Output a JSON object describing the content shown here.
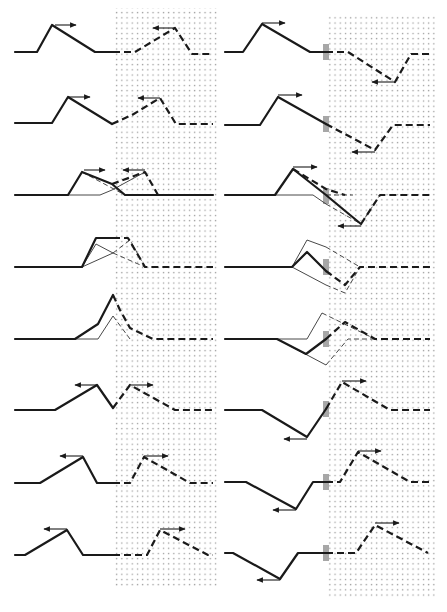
{
  "figure": {
    "colors": {
      "ink": "#1a1a1a",
      "stipple": "#9a9a9a",
      "background": "#ffffff",
      "boundary_marker": "#8a8a8a"
    },
    "regions": {
      "left_stipple": {
        "x": 113,
        "y": 8,
        "w": 104,
        "h": 580
      },
      "right_stipple": {
        "x": 326,
        "y": 15,
        "w": 110,
        "h": 582
      }
    },
    "left_column": [
      {
        "row": 1,
        "solid": "M15,52 L37,52 L52,25 L95,52 L113,52",
        "dash": "M113,52 L135,52 L175,28 L192,54 L213,54",
        "arrows": [
          [
            55,
            25,
            76,
            25
          ],
          [
            175,
            28,
            153,
            28
          ]
        ]
      },
      {
        "row": 2,
        "solid": "M15,123 L52,123 L68,97 L112,124",
        "dash": "M112,124 L132,115 L160,98 L176,124 L213,124",
        "arrows": [
          [
            68,
            97,
            90,
            97
          ],
          [
            160,
            98,
            138,
            98
          ]
        ]
      },
      {
        "row": 3,
        "solid": "M15,195 L68,195 L82,172 L112,184 L125,195 L213,195",
        "thin": "M68,195 L100,195 L112,190 L145,172",
        "thindash": "M82,172 L125,195",
        "dash": "M112,184 L145,172 L158,195 L213,195",
        "arrows": [
          [
            84,
            170,
            105,
            170
          ],
          [
            145,
            170,
            123,
            170
          ]
        ]
      },
      {
        "row": 4,
        "solid": "M15,267 L82,267 L96,238 L113,238",
        "thin": "M82,267 L96,244 L113,253 M82,267 L113,253",
        "thindash": "M113,253 L130,240 L145,267 M113,253 L145,267",
        "dash": "M113,238 L128,238 L145,267 L213,267"
      },
      {
        "row": 5,
        "solid": "M15,339 L75,339 L98,324 L113,295",
        "thin": "M75,339 L98,339 L113,316",
        "thindash": "M113,316 L130,339",
        "dash": "M113,295 L120,310 L130,328 L153,339 L213,339"
      },
      {
        "row": 6,
        "solid": "M15,410 L55,410 L97,385 L113,408",
        "dash": "M113,408 L130,385 L175,410 L213,410",
        "arrows": [
          [
            97,
            385,
            75,
            385
          ],
          [
            130,
            385,
            153,
            385
          ]
        ]
      },
      {
        "row": 7,
        "solid": "M15,483 L40,483 L83,457 L97,483 L113,483",
        "dash": "M113,483 L130,483 L144,457 L190,483 L213,483",
        "arrows": [
          [
            83,
            456,
            60,
            456
          ],
          [
            144,
            456,
            168,
            456
          ]
        ]
      },
      {
        "row": 8,
        "solid": "M15,555 L25,555 L67,530 L83,555 L113,555",
        "dash": "M113,555 L147,555 L160,530 L208,555 L213,555",
        "arrows": [
          [
            67,
            529,
            44,
            529
          ],
          [
            160,
            529,
            185,
            529
          ]
        ]
      }
    ],
    "right_column": [
      {
        "row": 1,
        "solid": "M225,52 L243,52 L262,24 L310,52 L326,52",
        "dash": "M326,52 L348,52 L395,82 L411,54 L430,54",
        "arrows": [
          [
            262,
            23,
            285,
            23
          ],
          [
            395,
            82,
            372,
            82
          ]
        ],
        "marker": [
          326,
          44,
          6,
          16
        ]
      },
      {
        "row": 2,
        "solid": "M225,125 L260,125 L278,97 L326,124",
        "dash": "M326,124 L375,150 L393,125 L430,125",
        "arrows": [
          [
            278,
            95,
            302,
            95
          ],
          [
            375,
            152,
            352,
            152
          ]
        ],
        "marker": [
          326,
          116,
          6,
          16
        ]
      },
      {
        "row": 3,
        "solid": "M225,195 L275,195 L293,169 L326,195 L344,210 L361,224",
        "thin": "M275,195 L313,195 L326,204",
        "thindash": "M326,195 L345,195 L353,195 M326,204 L361,224 L380,195",
        "dash": "M293,169 L326,189 L345,195 M361,224 L380,195 L430,195",
        "arrows": [
          [
            293,
            167,
            317,
            167
          ],
          [
            361,
            226,
            338,
            226
          ]
        ],
        "marker": [
          326,
          188,
          6,
          16
        ]
      },
      {
        "row": 4,
        "solid": "M225,267 L292,267 L307,252 L326,271",
        "thin": "M292,267 L307,240 L326,247 M292,267 L326,285",
        "thindash": "M326,247 L360,267 M326,285 L345,293 L360,267",
        "dash": "M326,271 L345,285 L360,267 L430,267",
        "marker": [
          326,
          259,
          6,
          16
        ]
      },
      {
        "row": 5,
        "solid": "M225,339 L277,339 L306,354 L326,339",
        "thin": "M277,339 L307,339 L322,313 M277,339 L326,365",
        "thindash": "M322,313 L375,339 M326,365 L348,339 L375,339",
        "dash": "M326,339 L345,322 L375,339 L430,339",
        "marker": [
          326,
          331,
          6,
          16
        ]
      },
      {
        "row": 6,
        "solid": "M225,410 L262,410 L307,437 L326,409",
        "dash": "M326,409 L342,382 L390,410 L430,410",
        "arrows": [
          [
            307,
            439,
            284,
            439
          ],
          [
            342,
            381,
            366,
            381
          ]
        ],
        "marker": [
          326,
          401,
          6,
          16
        ]
      },
      {
        "row": 7,
        "solid": "M225,482 L246,482 L296,509 L313,482 L326,482",
        "dash": "M326,482 L340,482 L358,452 L410,482 L430,482",
        "arrows": [
          [
            296,
            510,
            273,
            510
          ],
          [
            358,
            451,
            381,
            451
          ]
        ],
        "marker": [
          326,
          474,
          6,
          16
        ]
      },
      {
        "row": 8,
        "solid": "M225,553 L233,553 L280,579 L298,553 L326,553",
        "dash": "M326,553 L356,553 L375,525 L428,553",
        "arrows": [
          [
            280,
            580,
            257,
            580
          ],
          [
            375,
            523,
            399,
            523
          ]
        ],
        "marker": [
          326,
          545,
          6,
          16
        ]
      }
    ]
  }
}
